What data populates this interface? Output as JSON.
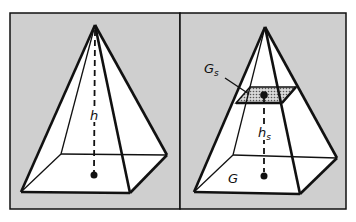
{
  "figure": {
    "background": "#ffffff",
    "panel_fill": "#cfcfcf",
    "face_fill": "#ffffff",
    "section_fill": "#9a9a9a",
    "stroke": "#111111"
  },
  "panels": [
    {
      "id": "left",
      "labels": {
        "height": "h"
      }
    },
    {
      "id": "right",
      "labels": {
        "section_area": "G",
        "section_sub": "s",
        "height": "h",
        "height_sub": "s",
        "base_area": "G"
      }
    }
  ]
}
